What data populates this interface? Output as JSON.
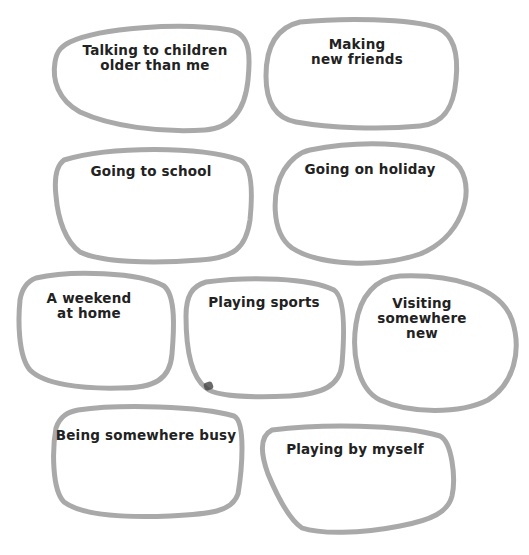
{
  "worksheet": {
    "style": {
      "stroke_color": "#a9a9a9",
      "text_color": "#222222",
      "background": "#ffffff"
    },
    "bubbles": [
      {
        "id": "talking-to-older-children",
        "label": "Talking to children\nolder than me"
      },
      {
        "id": "making-new-friends",
        "label": "Making\nnew friends"
      },
      {
        "id": "going-to-school",
        "label": "Going to school"
      },
      {
        "id": "going-on-holiday",
        "label": "Going on holiday"
      },
      {
        "id": "weekend-at-home",
        "label": "A weekend\nat home"
      },
      {
        "id": "playing-sports",
        "label": "Playing sports"
      },
      {
        "id": "visiting-somewhere-new",
        "label": "Visiting\nsomewhere new"
      },
      {
        "id": "being-somewhere-busy",
        "label": "Being somewhere busy"
      },
      {
        "id": "playing-by-myself",
        "label": "Playing by myself"
      }
    ]
  }
}
